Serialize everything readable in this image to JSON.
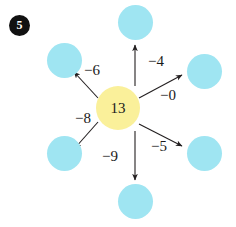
{
  "question": {
    "number": "5"
  },
  "diagram": {
    "type": "spider-subtraction",
    "center": {
      "value": "13",
      "color": "#faf09a"
    },
    "outer_color": "#9fe5f2",
    "branches": [
      {
        "id": "top",
        "operation": "−4",
        "direction": "up",
        "answer": ""
      },
      {
        "id": "top-right",
        "operation": "−0",
        "direction": "up-right",
        "answer": ""
      },
      {
        "id": "bottom-right",
        "operation": "−5",
        "direction": "down-right",
        "answer": ""
      },
      {
        "id": "bottom",
        "operation": "−9",
        "direction": "down",
        "answer": ""
      },
      {
        "id": "bottom-left",
        "operation": "−8",
        "direction": "down-left",
        "answer": ""
      },
      {
        "id": "top-left",
        "operation": "−6",
        "direction": "up-left",
        "answer": ""
      }
    ]
  }
}
